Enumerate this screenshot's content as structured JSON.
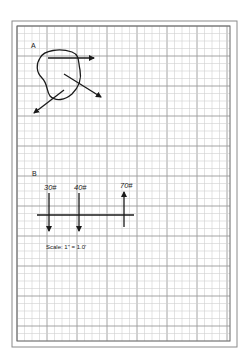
{
  "figure": {
    "part_a": {
      "label": "A",
      "description": "Irregular body with three force arrows"
    },
    "part_b": {
      "label": "B",
      "forces": [
        {
          "label": "30#",
          "magnitude": 30,
          "direction": "down"
        },
        {
          "label": "40#",
          "magnitude": 40,
          "direction": "down"
        },
        {
          "label": "70#",
          "magnitude": 70,
          "direction": "up"
        }
      ],
      "scale_text": "Scale: 1\" = 1.0'"
    }
  },
  "colors": {
    "ink": "#1a1a1a",
    "grid_minor": "#d0d0d0",
    "grid_major": "#9a9a9a",
    "frame": "#888888"
  }
}
